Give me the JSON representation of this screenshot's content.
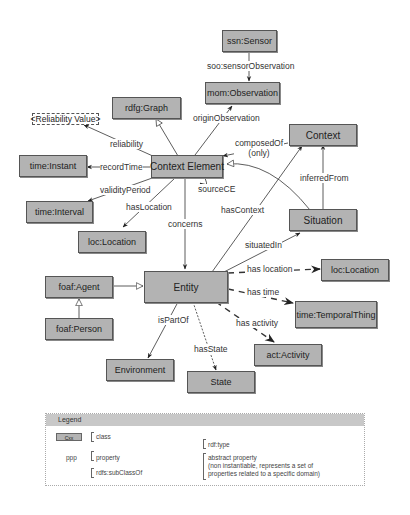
{
  "nodes": {
    "ssn_sensor": "ssn:Sensor",
    "mom_observation": "mom:Observation",
    "rdfg_graph": "rdfg:Graph",
    "reliability_value": "<Reliability Value>",
    "context_element": "Context Element",
    "context": "Context",
    "time_instant": "time:Instant",
    "time_interval": "time:Interval",
    "loc_location_1": "loc:Location",
    "situation": "Situation",
    "entity": "Entity",
    "foaf_agent": "foaf:Agent",
    "foaf_person": "foaf:Person",
    "loc_location_2": "loc:Location",
    "time_temporal_thing": "time:TemporalThing",
    "act_activity": "act:Activity",
    "environment": "Environment",
    "state": "State"
  },
  "edges": {
    "soo_sensor_observation": "soo:sensorObservation",
    "origin_observation": "originObservation",
    "reliability": "reliability",
    "record_time": "recordTime",
    "validity_period": "validityPeriod",
    "has_location": "hasLocation",
    "source_ce": "sourceCE",
    "composed_of": "composedOf",
    "composed_of_note": "(only)",
    "inferred_from": "inferredFrom",
    "concerns": "concerns",
    "has_context": "hasContext",
    "situated_in": "situatedIn",
    "has_location_abstract": "has location",
    "has_time": "has time",
    "has_activity": "has activity",
    "is_part_of": "isPartOf",
    "has_state": "hasState"
  },
  "legend": {
    "title": "Legend",
    "class_sample": "Cxx",
    "class_label": "class",
    "property_sample": "ppp",
    "property_label": "property",
    "subclass_label": "rdfs:subClassOf",
    "rdf_type_label": "rdf:type",
    "abstract_label_1": "abstract property",
    "abstract_label_2": "(non instantiable, represents a set of",
    "abstract_label_3": "properties related to a specific domain)"
  },
  "colors": {
    "node_fill": "#b3b3b3",
    "node_border": "#555555",
    "edge": "#333333",
    "legend_header": "#c8c8c8"
  }
}
